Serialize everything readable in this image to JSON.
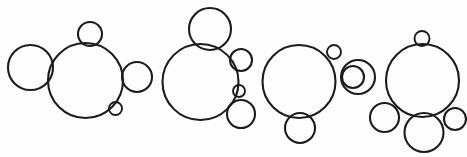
{
  "figure": {
    "type": "line-art",
    "width": 467,
    "height": 157,
    "background_color": "#fdfdfd",
    "stroke_color": "#1c1c1c",
    "fill": "none",
    "stroke_width": 2.1,
    "cluster_count": 4,
    "total_circle_count": 18
  },
  "chart_data": {
    "type": "scatter",
    "xlabel": "",
    "ylabel": "",
    "xlim": [
      0,
      467
    ],
    "ylim": [
      0,
      157
    ],
    "grid": false,
    "legend": false,
    "clusters": [
      {
        "name": "cluster-1",
        "circle_count": 5,
        "circles": [
          {
            "name": "main",
            "cx": 85.5,
            "cy": 80.5,
            "r": 37.5
          },
          {
            "name": "left-satellite",
            "cx": 30.5,
            "cy": 67.5,
            "r": 22.5
          },
          {
            "name": "top-satellite",
            "cx": 90.0,
            "cy": 34.0,
            "r": 12.0
          },
          {
            "name": "right-satellite",
            "cx": 137.0,
            "cy": 77.0,
            "r": 15.0
          },
          {
            "name": "lower-right-dot",
            "cx": 115.5,
            "cy": 108.5,
            "r": 6.5
          }
        ]
      },
      {
        "name": "cluster-2",
        "circle_count": 5,
        "circles": [
          {
            "name": "main",
            "cx": 200.5,
            "cy": 82.0,
            "r": 38.0
          },
          {
            "name": "top-satellite",
            "cx": 210.0,
            "cy": 29.0,
            "r": 21.0
          },
          {
            "name": "right-upper-satellite",
            "cx": 241.0,
            "cy": 60.0,
            "r": 11.0
          },
          {
            "name": "right-middle-dot",
            "cx": 239.0,
            "cy": 91.0,
            "r": 6.0
          },
          {
            "name": "right-lower-satellite",
            "cx": 241.0,
            "cy": 114.0,
            "r": 14.0
          }
        ]
      },
      {
        "name": "cluster-3",
        "circle_count": 5,
        "circles": [
          {
            "name": "main",
            "cx": 299.0,
            "cy": 81.5,
            "r": 36.5
          },
          {
            "name": "top-right-dot",
            "cx": 334.0,
            "cy": 52.0,
            "r": 7.0
          },
          {
            "name": "right-outer-satellite",
            "cx": 358.0,
            "cy": 77.0,
            "r": 17.0
          },
          {
            "name": "right-inner-satellite",
            "cx": 353.0,
            "cy": 77.0,
            "r": 11.0
          },
          {
            "name": "bottom-satellite",
            "cx": 300.0,
            "cy": 128.0,
            "r": 15.0
          }
        ]
      },
      {
        "name": "cluster-4",
        "circle_count": 5,
        "circles": [
          {
            "name": "main",
            "cx": 422.5,
            "cy": 80.5,
            "r": 36.5
          },
          {
            "name": "top-dot",
            "cx": 422.0,
            "cy": 38.5,
            "r": 7.5
          },
          {
            "name": "bottom-left-satellite",
            "cx": 384.5,
            "cy": 117.5,
            "r": 14.5
          },
          {
            "name": "bottom-center-satellite",
            "cx": 424.0,
            "cy": 132.5,
            "r": 19.5
          },
          {
            "name": "bottom-right-satellite",
            "cx": 455.0,
            "cy": 119.0,
            "r": 11.0
          }
        ]
      }
    ]
  }
}
